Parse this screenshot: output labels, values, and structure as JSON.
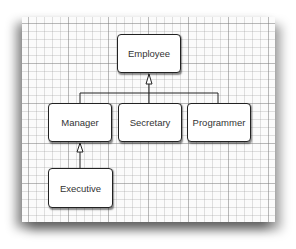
{
  "diagram": {
    "type": "uml-class-inheritance",
    "background": "graph-paper",
    "nodes": [
      {
        "id": "employee",
        "label": "Employee"
      },
      {
        "id": "manager",
        "label": "Manager"
      },
      {
        "id": "secretary",
        "label": "Secretary"
      },
      {
        "id": "programmer",
        "label": "Programmer"
      },
      {
        "id": "executive",
        "label": "Executive"
      }
    ],
    "edges": [
      {
        "from": "manager",
        "to": "employee",
        "kind": "inheritance"
      },
      {
        "from": "secretary",
        "to": "employee",
        "kind": "inheritance"
      },
      {
        "from": "programmer",
        "to": "employee",
        "kind": "inheritance"
      },
      {
        "from": "executive",
        "to": "manager",
        "kind": "inheritance"
      }
    ]
  }
}
